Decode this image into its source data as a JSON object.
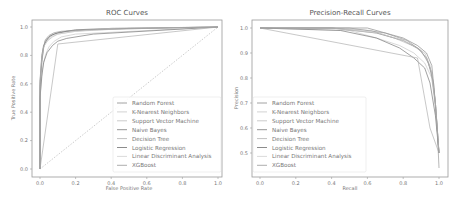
{
  "chart_data": [
    {
      "type": "line",
      "title": "ROC Curves",
      "xlabel": "False Positive Rate",
      "ylabel": "True Positive Rate",
      "xlim": [
        0.0,
        1.0
      ],
      "ylim": [
        0.0,
        1.0
      ],
      "xticks": [
        "0.0",
        "0.2",
        "0.4",
        "0.6",
        "0.8",
        "1.0"
      ],
      "yticks": [
        "0.0",
        "0.2",
        "0.4",
        "0.6",
        "0.8",
        "1.0"
      ],
      "grid": false,
      "legend_position": "lower right",
      "diagonal_reference": true,
      "series": [
        {
          "name": "Random Forest",
          "x": [
            0.0,
            0.0,
            0.01,
            0.02,
            0.03,
            0.05,
            0.08,
            0.15,
            0.3,
            0.6,
            1.0
          ],
          "y": [
            0.0,
            0.55,
            0.75,
            0.85,
            0.9,
            0.93,
            0.95,
            0.97,
            0.98,
            0.99,
            1.0
          ]
        },
        {
          "name": "K-Nearest Neighbors",
          "x": [
            0.0,
            0.0,
            0.01,
            0.03,
            0.05,
            0.08,
            0.12,
            0.2,
            1.0
          ],
          "y": [
            0.0,
            0.5,
            0.68,
            0.8,
            0.86,
            0.9,
            0.93,
            0.95,
            1.0
          ]
        },
        {
          "name": "Support Vector Machine",
          "x": [
            0.0,
            0.0,
            0.01,
            0.02,
            0.04,
            0.07,
            0.1,
            0.2,
            0.5,
            1.0
          ],
          "y": [
            0.0,
            0.6,
            0.78,
            0.86,
            0.9,
            0.93,
            0.95,
            0.97,
            0.99,
            1.0
          ]
        },
        {
          "name": "Naive Bayes",
          "x": [
            0.0,
            0.0,
            0.01,
            0.02,
            0.04,
            0.07,
            0.1,
            0.15,
            0.3,
            1.0
          ],
          "y": [
            0.0,
            0.5,
            0.65,
            0.75,
            0.82,
            0.87,
            0.9,
            0.92,
            0.95,
            1.0
          ]
        },
        {
          "name": "Decision Tree",
          "x": [
            0.0,
            0.1,
            1.0
          ],
          "y": [
            0.0,
            0.88,
            1.0
          ]
        },
        {
          "name": "Logistic Regression",
          "x": [
            0.0,
            0.0,
            0.01,
            0.02,
            0.04,
            0.06,
            0.1,
            0.2,
            0.4,
            1.0
          ],
          "y": [
            0.0,
            0.62,
            0.8,
            0.87,
            0.91,
            0.94,
            0.96,
            0.98,
            0.99,
            1.0
          ]
        },
        {
          "name": "Linear Discriminant Analysis",
          "x": [
            0.0,
            0.0,
            0.01,
            0.02,
            0.04,
            0.06,
            0.1,
            0.2,
            0.4,
            1.0
          ],
          "y": [
            0.0,
            0.6,
            0.78,
            0.86,
            0.9,
            0.93,
            0.95,
            0.97,
            0.99,
            1.0
          ]
        },
        {
          "name": "XGBoost",
          "x": [
            0.0,
            0.0,
            0.01,
            0.02,
            0.03,
            0.05,
            0.08,
            0.12,
            0.25,
            0.5,
            1.0
          ],
          "y": [
            0.0,
            0.58,
            0.76,
            0.86,
            0.91,
            0.94,
            0.96,
            0.97,
            0.98,
            0.99,
            1.0
          ]
        }
      ]
    },
    {
      "type": "line",
      "title": "Precision-Recall Curves",
      "xlabel": "Recall",
      "ylabel": "Precision",
      "xlim": [
        0.0,
        1.0
      ],
      "ylim": [
        0.42,
        1.0
      ],
      "xticks": [
        "0.0",
        "0.2",
        "0.4",
        "0.6",
        "0.8",
        "1.0"
      ],
      "yticks": [
        "0.5",
        "0.6",
        "0.7",
        "0.8",
        "0.9",
        "1.0"
      ],
      "grid": false,
      "legend_position": "lower left",
      "series": [
        {
          "name": "Random Forest",
          "x": [
            0.0,
            0.3,
            0.6,
            0.7,
            0.8,
            0.88,
            0.93,
            0.96,
            0.98,
            1.0
          ],
          "y": [
            1.0,
            1.0,
            1.0,
            0.98,
            0.96,
            0.93,
            0.9,
            0.85,
            0.7,
            0.5
          ]
        },
        {
          "name": "K-Nearest Neighbors",
          "x": [
            0.0,
            0.5,
            0.65,
            0.78,
            0.86,
            0.92,
            0.96,
            0.98,
            1.0
          ],
          "y": [
            1.0,
            0.99,
            0.96,
            0.93,
            0.9,
            0.86,
            0.8,
            0.68,
            0.5
          ]
        },
        {
          "name": "Support Vector Machine",
          "x": [
            0.0,
            0.4,
            0.62,
            0.75,
            0.85,
            0.92,
            0.95,
            0.98,
            1.0
          ],
          "y": [
            1.0,
            1.0,
            0.99,
            0.96,
            0.93,
            0.9,
            0.85,
            0.7,
            0.5
          ]
        },
        {
          "name": "Naive Bayes",
          "x": [
            0.0,
            0.45,
            0.65,
            0.78,
            0.86,
            0.92,
            0.95,
            0.98,
            1.0
          ],
          "y": [
            1.0,
            0.99,
            0.96,
            0.92,
            0.88,
            0.84,
            0.78,
            0.65,
            0.5
          ]
        },
        {
          "name": "Decision Tree",
          "x": [
            0.0,
            0.88,
            0.95,
            1.0
          ],
          "y": [
            1.0,
            0.88,
            0.6,
            0.5
          ]
        },
        {
          "name": "Logistic Regression",
          "x": [
            0.0,
            0.4,
            0.65,
            0.8,
            0.88,
            0.93,
            0.96,
            0.98,
            1.0
          ],
          "y": [
            1.0,
            1.0,
            0.98,
            0.95,
            0.92,
            0.88,
            0.82,
            0.7,
            0.5
          ]
        },
        {
          "name": "Linear Discriminant Analysis",
          "x": [
            0.0,
            0.4,
            0.66,
            0.8,
            0.88,
            0.93,
            0.96,
            0.98,
            1.0
          ],
          "y": [
            1.0,
            1.0,
            0.98,
            0.95,
            0.92,
            0.88,
            0.82,
            0.7,
            0.5
          ]
        },
        {
          "name": "XGBoost",
          "x": [
            0.0,
            0.5,
            0.7,
            0.82,
            0.9,
            0.94,
            0.97,
            0.99,
            1.0
          ],
          "y": [
            1.0,
            1.0,
            0.98,
            0.95,
            0.91,
            0.86,
            0.78,
            0.6,
            0.44
          ]
        }
      ]
    }
  ],
  "colors": {
    "series": [
      "#8c8c8c",
      "#c8c8c8",
      "#bdbdbd",
      "#7a7a7a",
      "#b0b0b0",
      "#6e6e6e",
      "#d0d0d0",
      "#999999"
    ],
    "frame": "#9a9a9a",
    "text": "#777777"
  }
}
